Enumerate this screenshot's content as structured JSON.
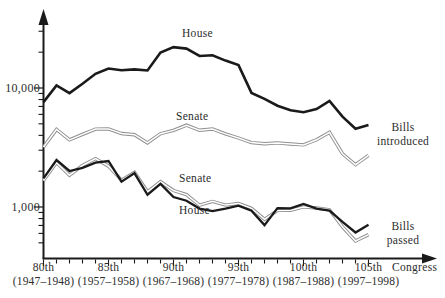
{
  "chart_data": {
    "type": "line",
    "x_label": "Congress",
    "y_scale": "log",
    "y_tick_labels": [
      "10,000",
      "1,000"
    ],
    "y_range_approx": [
      400,
      30000
    ],
    "grid": false,
    "x": [
      80,
      81,
      82,
      83,
      84,
      85,
      86,
      87,
      88,
      89,
      90,
      91,
      92,
      93,
      94,
      95,
      96,
      97,
      98,
      99,
      100,
      101,
      102,
      103,
      104,
      105
    ],
    "x_major_ticks": [
      {
        "congress": "80th",
        "years": "(1947–1948)"
      },
      {
        "congress": "85th",
        "years": "(1957–1958)"
      },
      {
        "congress": "90th",
        "years": "(1967–1968)"
      },
      {
        "congress": "95th",
        "years": "(1977–1978)"
      },
      {
        "congress": "100th",
        "years": "(1987–1988)"
      },
      {
        "congress": "105th",
        "years": "(1997–1998)"
      }
    ],
    "series": [
      {
        "name": "House bills introduced",
        "line_label": "House",
        "color": "#1a1a1a",
        "style": "solid",
        "values": [
          7611,
          10502,
          9065,
          10875,
          13169,
          14580,
          14112,
          14328,
          14022,
          19874,
          22060,
          21436,
          18561,
          18872,
          16982,
          15587,
          9103,
          8094,
          7105,
          6499,
          6263,
          6664,
          7771,
          5739,
          4542,
          4874
        ]
      },
      {
        "name": "Senate bills introduced",
        "line_label": "Senate",
        "color": "#8f8f8f",
        "style": "double",
        "values": [
          3186,
          4486,
          3665,
          4077,
          4518,
          4532,
          4149,
          4048,
          3457,
          4129,
          4400,
          4867,
          4408,
          4524,
          4115,
          3800,
          3480,
          3396,
          3454,
          3386,
          3325,
          3669,
          4245,
          2805,
          2266,
          2718
        ]
      },
      {
        "name": "Senate bills passed",
        "line_label": "Senate",
        "color": "#8f8f8f",
        "style": "double",
        "values": [
          1670,
          2362,
          1849,
          2231,
          2550,
          2202,
          1680,
          1953,
          1341,
          1636,
          1376,
          1271,
          1035,
          1115,
          1038,
          1070,
          976,
          786,
          936,
          940,
          1002,
          980,
          947,
          682,
          518,
          586
        ]
      },
      {
        "name": "House bills passed",
        "line_label": "House",
        "color": "#1a1a1a",
        "style": "solid",
        "values": [
          1739,
          2482,
          2008,
          2129,
          2360,
          2435,
          1636,
          1927,
          1267,
          1565,
          1213,
          1130,
          970,
          923,
          968,
          1027,
          929,
          704,
          978,
          973,
          1061,
          968,
          932,
          749,
          611,
          710
        ]
      }
    ],
    "annotations": {
      "bills_introduced": {
        "line1": "Bills",
        "line2": "introduced"
      },
      "bills_passed": {
        "line1": "Bills",
        "line2": "passed"
      }
    },
    "colors": {
      "house_line": "#1a1a1a",
      "senate_line": "#8f8f8f",
      "axis": "#1a1a1a",
      "text": "#2d2d2d"
    }
  }
}
